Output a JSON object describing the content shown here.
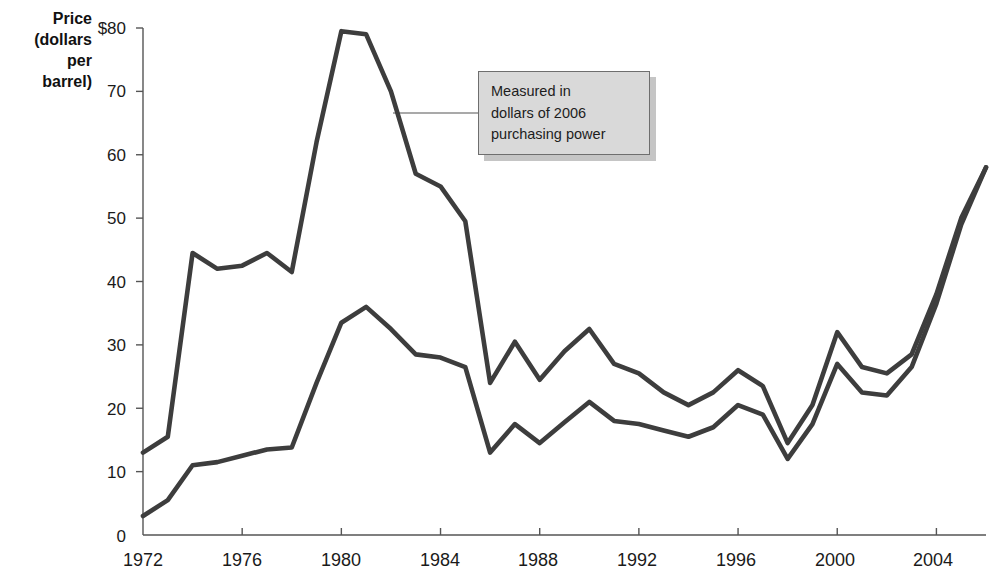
{
  "chart_data": {
    "type": "line",
    "title": "",
    "subtitle": "",
    "ylabel": "Price (dollars per barrel)",
    "ylabel_lines": [
      "Price",
      "(dollars",
      "per",
      "barrel)"
    ],
    "xlabel": "",
    "xlim": [
      1972,
      2006
    ],
    "ylim": [
      0,
      80
    ],
    "y_ticks": [
      0,
      10,
      20,
      30,
      40,
      50,
      60,
      70,
      80
    ],
    "y_tick_labels": [
      "0",
      "10",
      "20",
      "30",
      "40",
      "50",
      "60",
      "70",
      "$80"
    ],
    "x_ticks": [
      1972,
      1976,
      1980,
      1984,
      1988,
      1992,
      1996,
      2000,
      2004
    ],
    "x_tick_labels": [
      "1972",
      "1976",
      "1980",
      "1984",
      "1988",
      "1992",
      "1996",
      "2000",
      "2004"
    ],
    "grid": false,
    "legend_position": "none",
    "line_color": "#3d3d3d",
    "x": [
      1972,
      1973,
      1974,
      1975,
      1976,
      1977,
      1978,
      1979,
      1980,
      1981,
      1982,
      1983,
      1984,
      1985,
      1986,
      1987,
      1988,
      1989,
      1990,
      1991,
      1992,
      1993,
      1994,
      1995,
      1996,
      1997,
      1998,
      1999,
      2000,
      2001,
      2002,
      2003,
      2004,
      2005,
      2006
    ],
    "series": [
      {
        "name": "Real price (2006 dollars)",
        "values": [
          13.0,
          15.5,
          44.5,
          42.0,
          42.5,
          44.5,
          41.5,
          62.0,
          79.5,
          79.0,
          70.0,
          57.0,
          55.0,
          49.5,
          24.0,
          30.5,
          24.5,
          29.0,
          32.5,
          27.0,
          25.5,
          22.5,
          20.5,
          22.5,
          26.0,
          23.5,
          14.5,
          20.5,
          32.0,
          26.5,
          25.5,
          28.5,
          38.0,
          50.0,
          58.0
        ]
      },
      {
        "name": "Nominal price",
        "values": [
          3.0,
          5.5,
          11.0,
          11.5,
          12.5,
          13.5,
          13.8,
          24.0,
          33.5,
          36.0,
          32.5,
          28.5,
          28.0,
          26.5,
          13.0,
          17.5,
          14.5,
          17.8,
          21.0,
          18.0,
          17.5,
          16.5,
          15.5,
          17.0,
          20.5,
          19.0,
          12.0,
          17.5,
          27.0,
          22.5,
          22.0,
          26.5,
          36.5,
          49.0,
          58.0
        ]
      }
    ],
    "annotation": {
      "text": "Measured in dollars of 2006 purchasing power",
      "lines": [
        "Measured in",
        "dollars of 2006",
        "purchasing power"
      ],
      "target_x": 1982,
      "target_y": 67,
      "fill_color": "#d9d9d9",
      "border_color": "#6e6e6e"
    }
  }
}
